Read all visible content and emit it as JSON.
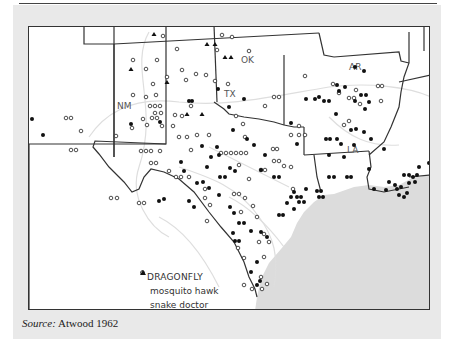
{
  "map": {
    "title": "",
    "states": [
      {
        "id": "NM",
        "label": "NM"
      },
      {
        "id": "TX",
        "label": "TX"
      },
      {
        "id": "OK",
        "label": "OK"
      },
      {
        "id": "AR",
        "label": "AR"
      },
      {
        "id": "LA",
        "label": "LA"
      }
    ],
    "legend": {
      "title": "DRAGONFLY",
      "items": [
        {
          "symbol": "filled-circle",
          "label": "mosquito hawk"
        },
        {
          "symbol": "open-circle",
          "label": "snake doctor"
        },
        {
          "symbol": "triangle",
          "label": "snake feeder"
        }
      ]
    },
    "colors": {
      "panel": "#e9e9e9",
      "gulf": "#dcdcdc",
      "land": "#ffffff",
      "border": "#333333",
      "rivers": "#dedede",
      "marker": "#111111"
    }
  },
  "source": {
    "prefix": "Source:",
    "text": "Atwood 1962"
  }
}
